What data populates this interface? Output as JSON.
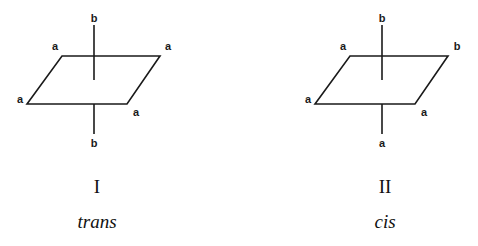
{
  "figure": {
    "background_color": "#ffffff",
    "stroke_color": "#1a1a1a",
    "text_color": "#111111"
  },
  "structures": [
    {
      "id": "structure-I",
      "numeral": "I",
      "isomer_name": "trans",
      "numeral_pos": {
        "x": 97,
        "y": 186
      },
      "name_pos": {
        "x": 97,
        "y": 221
      },
      "plane": {
        "top_left": {
          "x": 62,
          "y": 56
        },
        "top_right": {
          "x": 160,
          "y": 56
        },
        "bottom_right": {
          "x": 127,
          "y": 104
        },
        "bottom_left": {
          "x": 27,
          "y": 104
        }
      },
      "axis": {
        "x": 94,
        "top_y": 25,
        "center_y": 80,
        "bottom_y": 134
      },
      "substituents": [
        {
          "label": "b",
          "position": "axial-top",
          "x": 94,
          "y": 18
        },
        {
          "label": "a",
          "position": "equatorial-top-left",
          "x": 55,
          "y": 46
        },
        {
          "label": "a",
          "position": "equatorial-top-right",
          "x": 168,
          "y": 46
        },
        {
          "label": "a",
          "position": "equatorial-bottom-left",
          "x": 20,
          "y": 99
        },
        {
          "label": "a",
          "position": "equatorial-bottom-right",
          "x": 136,
          "y": 112
        },
        {
          "label": "b",
          "position": "axial-bottom",
          "x": 94,
          "y": 143
        }
      ]
    },
    {
      "id": "structure-II",
      "numeral": "II",
      "isomer_name": "cis",
      "numeral_pos": {
        "x": 385,
        "y": 186
      },
      "name_pos": {
        "x": 385,
        "y": 221
      },
      "plane": {
        "top_left": {
          "x": 350,
          "y": 56
        },
        "top_right": {
          "x": 448,
          "y": 56
        },
        "bottom_right": {
          "x": 415,
          "y": 104
        },
        "bottom_left": {
          "x": 315,
          "y": 104
        }
      },
      "axis": {
        "x": 382,
        "top_y": 25,
        "center_y": 80,
        "bottom_y": 134
      },
      "substituents": [
        {
          "label": "b",
          "position": "axial-top",
          "x": 382,
          "y": 18
        },
        {
          "label": "a",
          "position": "equatorial-top-left",
          "x": 343,
          "y": 46
        },
        {
          "label": "b",
          "position": "equatorial-top-right",
          "x": 457,
          "y": 46
        },
        {
          "label": "a",
          "position": "equatorial-bottom-left",
          "x": 308,
          "y": 99
        },
        {
          "label": "a",
          "position": "equatorial-bottom-right",
          "x": 424,
          "y": 112
        },
        {
          "label": "a",
          "position": "axial-bottom",
          "x": 382,
          "y": 143
        }
      ]
    }
  ]
}
